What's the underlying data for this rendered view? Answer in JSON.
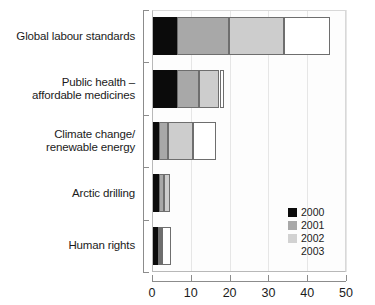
{
  "chart_data": {
    "type": "bar",
    "orientation": "horizontal",
    "stacked": true,
    "title": "",
    "xlabel": "",
    "ylabel": "",
    "xlim": [
      0,
      50
    ],
    "xticks": [
      0,
      10,
      20,
      30,
      40,
      50
    ],
    "xtick_labels": [
      "0",
      "10",
      "20",
      "30",
      "40",
      "50"
    ],
    "grid": true,
    "legend_position": "inside-right-lower",
    "categories": [
      "Global labour standards",
      "Public health – affordable medicines",
      "Climate change/ renewable energy",
      "Arctic drilling",
      "Human rights"
    ],
    "category_lines": [
      [
        "Global labour standards"
      ],
      [
        "Public health –",
        "affordable medicines"
      ],
      [
        "Climate change/",
        "renewable energy"
      ],
      [
        "Arctic drilling"
      ],
      [
        "Human rights"
      ]
    ],
    "series": [
      {
        "name": "2000",
        "color": "#0b0b0b",
        "values": [
          6.4,
          6.5,
          1.9,
          1.9,
          1.5
        ]
      },
      {
        "name": "2001",
        "color": "#a8a8a8",
        "values": [
          13.4,
          5.5,
          2.3,
          1.2,
          0.6
        ]
      },
      {
        "name": "2002",
        "color": "#cdcdcd",
        "values": [
          14.3,
          5.4,
          6.4,
          1.6,
          0.5
        ]
      },
      {
        "name": "2003",
        "color": "#ffffff",
        "values": [
          11.9,
          1.2,
          5.9,
          0.0,
          2.2
        ]
      }
    ],
    "totals": [
      46.0,
      18.6,
      16.5,
      4.7,
      4.8
    ]
  },
  "legend": {
    "entries": [
      {
        "label": "2000",
        "key": "y2000"
      },
      {
        "label": "2001",
        "key": "y2001"
      },
      {
        "label": "2002",
        "key": "y2002"
      },
      {
        "label": "2003",
        "key": "y2003"
      }
    ]
  },
  "cropped_header": ""
}
